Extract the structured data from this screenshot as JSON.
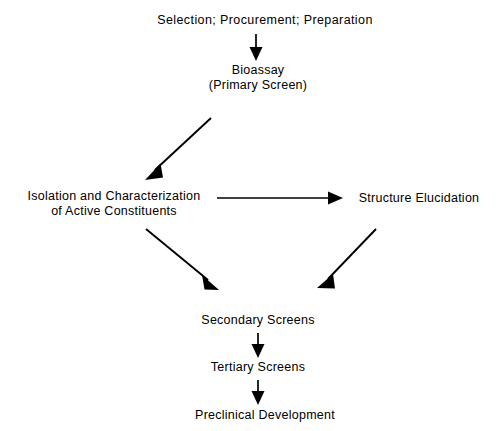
{
  "diagram": {
    "background_color": "#ffffff",
    "line_color": "#000000",
    "text_color": "#000000",
    "nodes": [
      {
        "id": "selection",
        "lines": [
          "Selection;  Procurement;  Preparation"
        ]
      },
      {
        "id": "bioassay",
        "lines": [
          "Bioassay",
          "(Primary  Screen)"
        ]
      },
      {
        "id": "isolation",
        "lines": [
          "Isolation and Characterization",
          "of  Active  Constituents"
        ]
      },
      {
        "id": "structure",
        "lines": [
          "Structure  Elucidation"
        ]
      },
      {
        "id": "secondary",
        "lines": [
          "Secondary  Screens"
        ]
      },
      {
        "id": "tertiary",
        "lines": [
          "Tertiary  Screens"
        ]
      },
      {
        "id": "preclinical",
        "lines": [
          "Preclinical  Development"
        ]
      }
    ],
    "edges": [
      {
        "id": "selection-to-bioassay",
        "from": "selection",
        "to": "bioassay",
        "direction": "down"
      },
      {
        "id": "bioassay-to-isolation",
        "from": "bioassay",
        "to": "isolation",
        "direction": "down-left"
      },
      {
        "id": "isolation-to-structure",
        "from": "isolation",
        "to": "structure",
        "direction": "right"
      },
      {
        "id": "isolation-to-secondary",
        "from": "isolation",
        "to": "secondary",
        "direction": "down-right"
      },
      {
        "id": "structure-to-secondary",
        "from": "structure",
        "to": "secondary",
        "direction": "down-left"
      },
      {
        "id": "secondary-to-tertiary",
        "from": "secondary",
        "to": "tertiary",
        "direction": "down"
      },
      {
        "id": "tertiary-to-preclinical",
        "from": "tertiary",
        "to": "preclinical",
        "direction": "down"
      }
    ]
  }
}
